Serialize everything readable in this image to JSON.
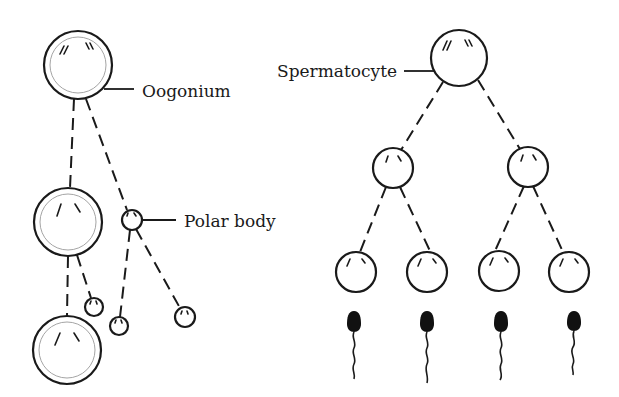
{
  "labels": {
    "oogonium": "Oogonium",
    "polar_body": "Polar body",
    "spermatocyte": "Spermatocyte"
  },
  "oogenesis": {
    "cells": [
      {
        "role": "oogonium",
        "cx": 78,
        "cy": 65,
        "r": 34
      },
      {
        "role": "secondary-oocyte",
        "cx": 68,
        "cy": 222,
        "r": 34
      },
      {
        "role": "ovum",
        "cx": 67,
        "cy": 350,
        "r": 34
      },
      {
        "role": "first-polar-body",
        "cx": 132,
        "cy": 220,
        "r": 10
      },
      {
        "role": "second-polar-body",
        "cx": 94,
        "cy": 307,
        "r": 9
      },
      {
        "role": "polar-body-division-left",
        "cx": 119,
        "cy": 326,
        "r": 9
      },
      {
        "role": "polar-body-division-right",
        "cx": 185,
        "cy": 317,
        "r": 10
      }
    ]
  },
  "spermatogenesis": {
    "cells": [
      {
        "role": "primary-spermatocyte",
        "cx": 459,
        "cy": 58,
        "r": 28
      },
      {
        "role": "secondary-spermatocyte-left",
        "cx": 393,
        "cy": 168,
        "r": 20
      },
      {
        "role": "secondary-spermatocyte-right",
        "cx": 528,
        "cy": 167,
        "r": 20
      },
      {
        "role": "spermatid-1",
        "cx": 356,
        "cy": 272,
        "r": 20
      },
      {
        "role": "spermatid-2",
        "cx": 427,
        "cy": 272,
        "r": 20
      },
      {
        "role": "spermatid-3",
        "cx": 499,
        "cy": 272,
        "r": 20
      },
      {
        "role": "spermatid-4",
        "cx": 569,
        "cy": 272,
        "r": 20
      }
    ],
    "sperm_count": 4
  },
  "colors": {
    "ink": "#1a1a1a",
    "background": "#ffffff"
  }
}
